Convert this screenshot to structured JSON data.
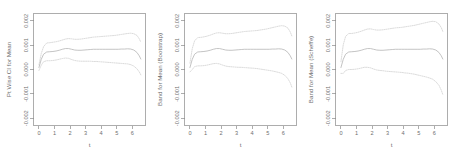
{
  "figure": {
    "background": "#ffffff",
    "panel_count": 3,
    "line_colors": {
      "mean": "#b9b9b9",
      "band": "#d2d2d2",
      "axis": "#8a8a8a",
      "text": "#6f6f6f"
    }
  },
  "chart_data": [
    {
      "type": "line",
      "title": "",
      "xlabel": "t",
      "ylabel": "Pt Wise CI for Mean",
      "xlim": [
        -0.35,
        6.85
      ],
      "ylim": [
        -0.0023,
        0.0023
      ],
      "xticks": [
        0,
        1,
        2,
        3,
        4,
        5,
        6
      ],
      "xtick_labels": [
        "0",
        "1",
        "2",
        "3",
        "4",
        "5",
        "6"
      ],
      "yticks": [
        -0.002,
        -0.001,
        0.0,
        0.001,
        0.002
      ],
      "ytick_labels": [
        "-0.002",
        "-0.001",
        "0.000",
        "0.001",
        "0.002"
      ],
      "grid": false,
      "legend": "none",
      "x": [
        0.0,
        0.15,
        0.3,
        0.5,
        0.7,
        0.9,
        1.1,
        1.3,
        1.5,
        1.7,
        1.9,
        2.1,
        2.3,
        2.5,
        2.7,
        2.9,
        3.1,
        3.3,
        3.5,
        3.7,
        3.9,
        4.1,
        4.3,
        4.5,
        4.7,
        4.9,
        5.1,
        5.3,
        5.5,
        5.7,
        5.9,
        6.1,
        6.3,
        6.45,
        6.55
      ],
      "series": [
        {
          "name": "Upper CI",
          "style": "dotted",
          "values": [
            0.00019,
            0.00066,
            0.00094,
            0.00109,
            0.0011,
            0.00112,
            0.00114,
            0.00117,
            0.00121,
            0.00125,
            0.00127,
            0.00126,
            0.00124,
            0.00124,
            0.00125,
            0.00127,
            0.00129,
            0.00131,
            0.00133,
            0.00134,
            0.00135,
            0.00136,
            0.00137,
            0.00138,
            0.00139,
            0.0014,
            0.00142,
            0.00144,
            0.00146,
            0.00148,
            0.00149,
            0.00147,
            0.0014,
            0.00126,
            0.00112
          ]
        },
        {
          "name": "Mean",
          "style": "solid",
          "values": [
            8e-05,
            0.00042,
            0.00063,
            0.00072,
            0.00073,
            0.00074,
            0.00076,
            0.00079,
            0.00083,
            0.00086,
            0.00086,
            0.00083,
            0.0008,
            0.00079,
            0.00079,
            0.0008,
            0.00081,
            0.00082,
            0.00083,
            0.00083,
            0.00083,
            0.00083,
            0.00083,
            0.00083,
            0.00083,
            0.00083,
            0.00083,
            0.00084,
            0.00084,
            0.00085,
            0.00084,
            0.0008,
            0.0007,
            0.00056,
            0.00043
          ]
        },
        {
          "name": "Lower CI",
          "style": "dotted",
          "values": [
            -4e-05,
            0.00018,
            0.00032,
            0.00036,
            0.00036,
            0.00037,
            0.00039,
            0.00042,
            0.00045,
            0.00047,
            0.00046,
            0.00041,
            0.00037,
            0.00035,
            0.00034,
            0.00034,
            0.00034,
            0.00034,
            0.00033,
            0.00033,
            0.00032,
            0.00031,
            0.0003,
            0.00029,
            0.00028,
            0.00027,
            0.00026,
            0.00025,
            0.00024,
            0.00023,
            0.0002,
            0.00014,
            3e-05,
            -0.0001,
            -0.00022
          ]
        }
      ]
    },
    {
      "type": "line",
      "title": "",
      "xlabel": "t",
      "ylabel": "Band for Mean (Bootstrap)",
      "xlim": [
        -0.35,
        6.85
      ],
      "ylim": [
        -0.0023,
        0.0023
      ],
      "xticks": [
        0,
        1,
        2,
        3,
        4,
        5,
        6
      ],
      "xtick_labels": [
        "0",
        "1",
        "2",
        "3",
        "4",
        "5",
        "6"
      ],
      "yticks": [
        -0.002,
        -0.001,
        0.0,
        0.001,
        0.002
      ],
      "ytick_labels": [
        "-0.002",
        "-0.001",
        "0.000",
        "0.001",
        "0.002"
      ],
      "grid": false,
      "legend": "none",
      "x": [
        0.0,
        0.15,
        0.3,
        0.5,
        0.7,
        0.9,
        1.1,
        1.3,
        1.5,
        1.7,
        1.9,
        2.1,
        2.3,
        2.5,
        2.7,
        2.9,
        3.1,
        3.3,
        3.5,
        3.7,
        3.9,
        4.1,
        4.3,
        4.5,
        4.7,
        4.9,
        5.1,
        5.3,
        5.5,
        5.7,
        5.9,
        6.1,
        6.3,
        6.45,
        6.55
      ],
      "series": [
        {
          "name": "Upper Band",
          "style": "dotted",
          "values": [
            0.00026,
            0.00086,
            0.00118,
            0.00131,
            0.00132,
            0.00134,
            0.00137,
            0.00141,
            0.00146,
            0.0015,
            0.00151,
            0.00149,
            0.00147,
            0.00147,
            0.00148,
            0.0015,
            0.00152,
            0.00154,
            0.00156,
            0.00157,
            0.00158,
            0.00159,
            0.0016,
            0.00162,
            0.00164,
            0.00166,
            0.00169,
            0.00172,
            0.00175,
            0.00178,
            0.0018,
            0.00178,
            0.0017,
            0.00154,
            0.00138
          ]
        },
        {
          "name": "Mean",
          "style": "solid",
          "values": [
            8e-05,
            0.00042,
            0.00063,
            0.00072,
            0.00073,
            0.00074,
            0.00076,
            0.00079,
            0.00083,
            0.00086,
            0.00086,
            0.00083,
            0.0008,
            0.00079,
            0.00079,
            0.0008,
            0.00081,
            0.00082,
            0.00083,
            0.00083,
            0.00083,
            0.00083,
            0.00083,
            0.00083,
            0.00083,
            0.00083,
            0.00083,
            0.00084,
            0.00084,
            0.00085,
            0.00084,
            0.0008,
            0.0007,
            0.00056,
            0.00043
          ]
        },
        {
          "name": "Lower Band",
          "style": "dotted",
          "values": [
            -0.0001,
            0.0,
            0.00012,
            0.00015,
            0.00015,
            0.00016,
            0.00018,
            0.00021,
            0.00024,
            0.00025,
            0.00023,
            0.00018,
            0.00014,
            0.00012,
            0.00011,
            0.0001,
            9e-05,
            9e-05,
            8e-05,
            7e-05,
            6e-05,
            5e-05,
            4e-05,
            2e-05,
            0.0,
            -2e-05,
            -4e-05,
            -6e-05,
            -9e-05,
            -0.00012,
            -0.00016,
            -0.00024,
            -0.00038,
            -0.00055,
            -0.00072
          ]
        }
      ]
    },
    {
      "type": "line",
      "title": "",
      "xlabel": "t",
      "ylabel": "Band for Mean (Scheffe)",
      "xlim": [
        -0.35,
        6.85
      ],
      "ylim": [
        -0.0023,
        0.0023
      ],
      "xticks": [
        0,
        1,
        2,
        3,
        4,
        5,
        6
      ],
      "xtick_labels": [
        "0",
        "1",
        "2",
        "3",
        "4",
        "5",
        "6"
      ],
      "yticks": [
        -0.002,
        -0.001,
        0.0,
        0.001,
        0.002
      ],
      "ytick_labels": [
        "-0.002",
        "-0.001",
        "0.000",
        "0.001",
        "0.002"
      ],
      "grid": false,
      "legend": "none",
      "x": [
        0.0,
        0.15,
        0.3,
        0.5,
        0.7,
        0.9,
        1.1,
        1.3,
        1.5,
        1.7,
        1.9,
        2.1,
        2.3,
        2.5,
        2.7,
        2.9,
        3.1,
        3.3,
        3.5,
        3.7,
        3.9,
        4.1,
        4.3,
        4.5,
        4.7,
        4.9,
        5.1,
        5.3,
        5.5,
        5.7,
        5.9,
        6.1,
        6.3,
        6.45,
        6.55
      ],
      "series": [
        {
          "name": "Upper Band",
          "style": "dotted",
          "values": [
            0.00032,
            0.00102,
            0.00136,
            0.00148,
            0.00148,
            0.0015,
            0.00153,
            0.00157,
            0.00162,
            0.00166,
            0.00167,
            0.00164,
            0.00162,
            0.00162,
            0.00163,
            0.00165,
            0.00167,
            0.00169,
            0.00171,
            0.00172,
            0.00173,
            0.00175,
            0.00177,
            0.00179,
            0.00181,
            0.00184,
            0.00187,
            0.0019,
            0.00193,
            0.00196,
            0.00198,
            0.00196,
            0.00187,
            0.00172,
            0.00156
          ]
        },
        {
          "name": "Mean",
          "style": "solid",
          "values": [
            8e-05,
            0.00042,
            0.00063,
            0.00072,
            0.00073,
            0.00074,
            0.00076,
            0.00079,
            0.00083,
            0.00086,
            0.00086,
            0.00083,
            0.0008,
            0.00079,
            0.00079,
            0.0008,
            0.00081,
            0.00082,
            0.00083,
            0.00083,
            0.00083,
            0.00083,
            0.00083,
            0.00083,
            0.00083,
            0.00083,
            0.00083,
            0.00084,
            0.00084,
            0.00085,
            0.00084,
            0.0008,
            0.0007,
            0.00056,
            0.00043
          ]
        },
        {
          "name": "Lower Band",
          "style": "dotted",
          "values": [
            -0.00016,
            -0.00016,
            -4e-05,
            0.0,
            0.0,
            1e-05,
            3e-05,
            6e-05,
            9e-05,
            9e-05,
            7e-05,
            2e-05,
            -2e-05,
            -4e-05,
            -5e-05,
            -7e-05,
            -8e-05,
            -9e-05,
            -0.0001,
            -0.00011,
            -0.00012,
            -0.00014,
            -0.00015,
            -0.00017,
            -0.00019,
            -0.00022,
            -0.00025,
            -0.00028,
            -0.00031,
            -0.00035,
            -0.0004,
            -0.0005,
            -0.00065,
            -0.00085,
            -0.00103
          ]
        }
      ]
    }
  ]
}
